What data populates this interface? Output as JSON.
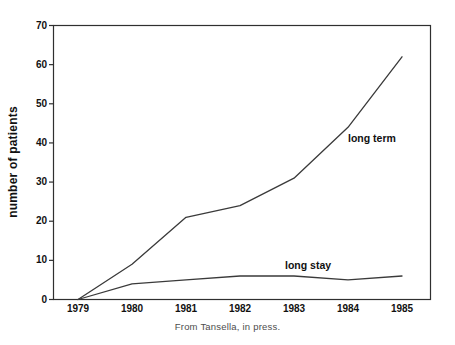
{
  "figure": {
    "caption": "From Tansella, in press."
  },
  "chart_data": {
    "type": "line",
    "title": "",
    "xlabel": "",
    "ylabel": "number of patients",
    "categories": [
      "1979",
      "1980",
      "1981",
      "1982",
      "1983",
      "1984",
      "1985"
    ],
    "y_ticks": [
      0,
      10,
      20,
      30,
      40,
      50,
      60,
      70
    ],
    "ylim": [
      0,
      70
    ],
    "grid": false,
    "legend_position": "inline-annotations",
    "line_color": "#3a3a3a",
    "frame_color": "#2f2f2f",
    "series": [
      {
        "name": "long term",
        "values": [
          0,
          9,
          21,
          24,
          31,
          44,
          62
        ]
      },
      {
        "name": "long stay",
        "values": [
          0,
          4,
          5,
          6,
          6,
          5,
          6
        ]
      }
    ]
  }
}
